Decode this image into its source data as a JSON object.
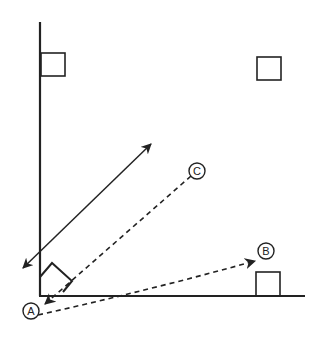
{
  "diagram": {
    "colors": {
      "stroke": "#222222",
      "background": "#ffffff"
    },
    "labels": {
      "A": "A",
      "B": "B",
      "C": "C"
    },
    "elements": {
      "vertical_surface": "wall",
      "horizontal_surface": "floor",
      "blocks": [
        "wall-block-top",
        "floating-block-top-right",
        "floor-block-right",
        "corner-tilted-block"
      ],
      "arrows": [
        {
          "name": "double-headed-solid-arrow",
          "style": "solid"
        },
        {
          "name": "dashed-arrow-to-A",
          "style": "dashed",
          "target": "A"
        },
        {
          "name": "dashed-arrow-to-B",
          "style": "dashed",
          "target": "B"
        }
      ]
    }
  }
}
